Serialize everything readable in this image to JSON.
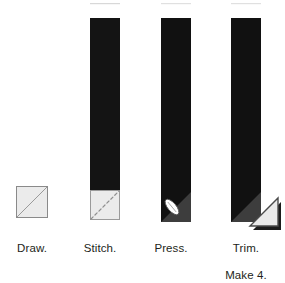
{
  "diagram": {
    "kind": "quilting-block-construction-sequence",
    "title": "",
    "background_color": "#ffffff",
    "colors": {
      "fabric_dark": "#1a1a1a",
      "fabric_dark_alt": "#111111",
      "fabric_light": "#e9e9e9",
      "fabric_light_fill": "#ebebeb",
      "outline_gray": "#8a8a8a",
      "outline_dark": "#2b2b2b",
      "shadow_triangle": "#3a3a3a",
      "stitch_line": "#9a9a9a",
      "iron_white": "#ffffff",
      "text": "#231f20"
    },
    "steps": [
      {
        "id": "draw",
        "index": 1,
        "label": "Draw.",
        "caption_lines": [
          "Draw."
        ],
        "description": "small light square with drawn diagonal line corner to corner",
        "shapes": [
          "light-square",
          "diagonal-draw-line"
        ]
      },
      {
        "id": "stitch",
        "index": 2,
        "label": "Stitch.",
        "caption_lines": [
          "Stitch."
        ],
        "description": "long dark strip with light square sewn at bottom end, dashed stitching line on the diagonal",
        "shapes": [
          "dark-strip",
          "light-square",
          "dashed-stitch-line"
        ]
      },
      {
        "id": "press",
        "index": 3,
        "label": "Press.",
        "caption_lines": [
          "Press."
        ],
        "description": "long dark strip with corner folded open and pressed, iron icon on the pressed corner",
        "shapes": [
          "dark-strip",
          "pressed-corner-triangle",
          "iron-icon"
        ]
      },
      {
        "id": "trim",
        "index": 4,
        "label": "Trim. Make 4.",
        "caption_lines": [
          "Trim.",
          "Make 4."
        ],
        "description": "long dark strip with excess corner fabric trimmed away and set aside to the right",
        "shapes": [
          "dark-strip",
          "pressed-corner-triangle",
          "trimmed-offcut",
          "offcut-shadow"
        ]
      }
    ]
  }
}
